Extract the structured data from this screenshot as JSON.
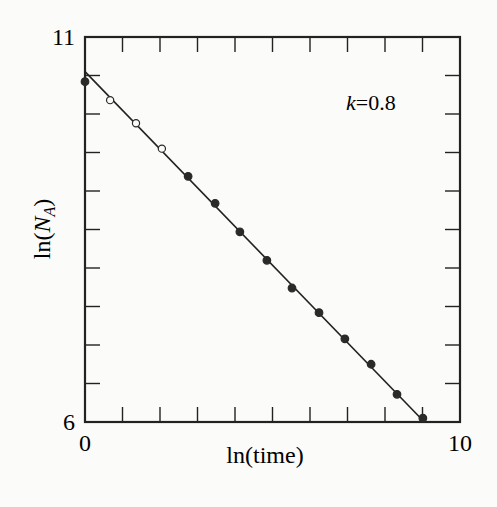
{
  "chart_data": {
    "type": "scatter",
    "title": "",
    "xlabel": "ln(time)",
    "ylabel": "ln(N_A)",
    "ylabel_parts": {
      "prefix": "ln(",
      "var": "N",
      "sub": "A",
      "suffix": ")"
    },
    "xlim": [
      0,
      10
    ],
    "ylim": [
      6,
      11
    ],
    "x_tick_labels": [
      "0",
      "10"
    ],
    "y_tick_labels": [
      "6",
      "11"
    ],
    "x_minor_ticks": [
      1,
      2,
      3,
      4,
      5,
      6,
      7,
      8,
      9
    ],
    "y_minor_ticks": [
      6.5,
      7.0,
      7.5,
      8.0,
      8.5,
      9.0,
      9.5,
      10.0,
      10.5
    ],
    "grid": false,
    "annotation": {
      "var": "k",
      "text": "=0.8",
      "x": 7.0,
      "y": 10.05
    },
    "series": [
      {
        "name": "open",
        "marker": "open-circle",
        "x": [
          0.67,
          1.36,
          2.05
        ],
        "y": [
          10.18,
          9.88,
          9.55
        ]
      },
      {
        "name": "filled",
        "marker": "filled-circle",
        "x": [
          0.0,
          2.75,
          3.47,
          4.13,
          4.85,
          5.52,
          6.24,
          6.93,
          7.63,
          8.32,
          9.01
        ],
        "y": [
          10.42,
          9.19,
          8.84,
          8.47,
          8.1,
          7.74,
          7.42,
          7.08,
          6.75,
          6.36,
          6.05
        ]
      }
    ],
    "fit_line": {
      "x": [
        0,
        9.05
      ],
      "y": [
        10.55,
        6.0
      ],
      "slope": -0.5
    }
  }
}
